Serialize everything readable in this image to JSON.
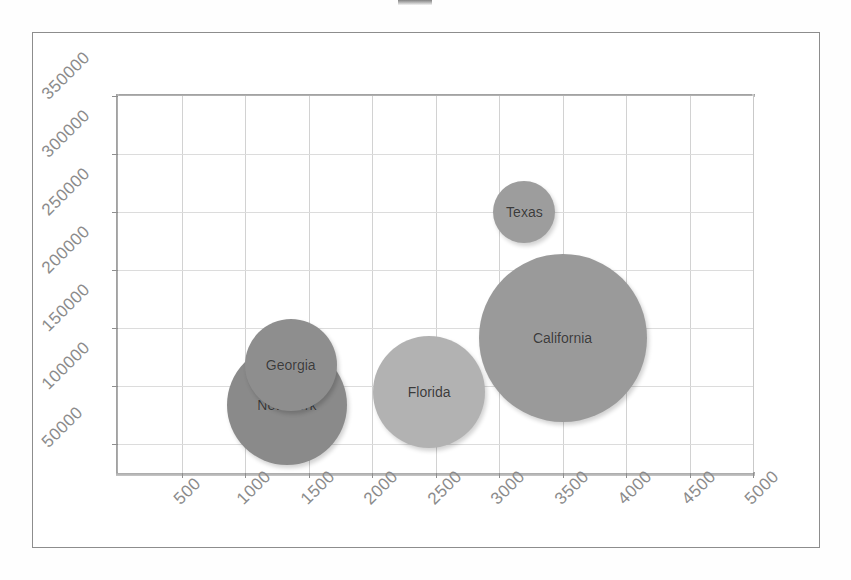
{
  "chart_data": {
    "type": "scatter",
    "title": "",
    "xlabel": "",
    "ylabel": "",
    "xlim": [
      0,
      5000
    ],
    "ylim": [
      25000,
      350000
    ],
    "xticks": [
      "500",
      "1000",
      "1500",
      "2000",
      "2500",
      "3000",
      "3500",
      "4000",
      "4500",
      "5000"
    ],
    "xtick_values": [
      500,
      1000,
      1500,
      2000,
      2500,
      3000,
      3500,
      4000,
      4500,
      5000
    ],
    "yticks": [
      "50000",
      "100000",
      "150000",
      "200000",
      "250000",
      "300000",
      "350000"
    ],
    "ytick_values": [
      50000,
      100000,
      150000,
      200000,
      250000,
      300000,
      350000
    ],
    "grid": true,
    "legend": "none",
    "bubbles": [
      {
        "label": "Texas",
        "x": 3200,
        "y": 250000,
        "size": 62,
        "color": "#9d9d9d"
      },
      {
        "label": "California",
        "x": 3500,
        "y": 141000,
        "size": 168,
        "color": "#9a9a9a"
      },
      {
        "label": "Florida",
        "x": 2450,
        "y": 95000,
        "size": 112,
        "color": "#b2b2b2"
      },
      {
        "label": "Georgia",
        "x": 1360,
        "y": 118000,
        "size": 92,
        "color": "#8e8e8e"
      },
      {
        "label": "New York",
        "x": 1330,
        "y": 84000,
        "size": 120,
        "color": "#8a8a8a"
      }
    ]
  },
  "colors": {
    "frame": "#8d8d8d",
    "grid": "#d2d2d2",
    "axis_text": "#8b8b8b",
    "bubble_label": "#3b3b3b",
    "background": "#ffffff"
  }
}
